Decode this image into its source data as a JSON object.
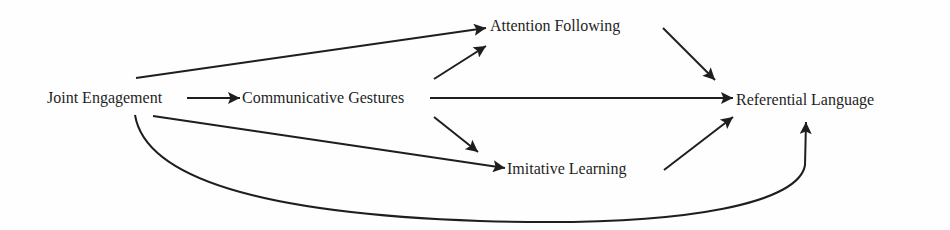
{
  "diagram": {
    "type": "path-diagram",
    "nodes": {
      "joint_engagement": "Joint Engagement",
      "communicative_gestures": "Communicative Gestures",
      "attention_following": "Attention Following",
      "imitative_learning": "Imitative Learning",
      "referential_language": "Referential Language"
    },
    "edges": [
      {
        "from": "Joint Engagement",
        "to": "Communicative Gestures"
      },
      {
        "from": "Joint Engagement",
        "to": "Attention Following"
      },
      {
        "from": "Joint Engagement",
        "to": "Imitative Learning"
      },
      {
        "from": "Joint Engagement",
        "to": "Referential Language"
      },
      {
        "from": "Communicative Gestures",
        "to": "Attention Following"
      },
      {
        "from": "Communicative Gestures",
        "to": "Imitative Learning"
      },
      {
        "from": "Communicative Gestures",
        "to": "Referential Language"
      },
      {
        "from": "Attention Following",
        "to": "Referential Language"
      },
      {
        "from": "Imitative Learning",
        "to": "Referential Language"
      }
    ],
    "colors": {
      "line": "#1e1e1e",
      "background": "#fefefe"
    }
  }
}
